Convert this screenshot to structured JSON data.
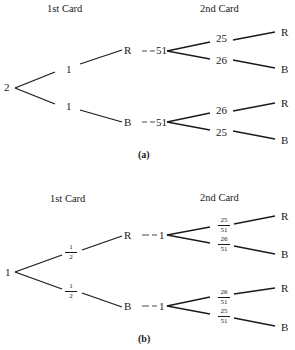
{
  "panel_a": {
    "header_first": "1st Card",
    "header_second": "2nd Card",
    "root": "2",
    "first_branches": [
      {
        "weight": "1",
        "node": "R",
        "link": "51",
        "second": [
          {
            "weight": "25",
            "leaf": "R"
          },
          {
            "weight": "26",
            "leaf": "B"
          }
        ]
      },
      {
        "weight": "1",
        "node": "B",
        "link": "51",
        "second": [
          {
            "weight": "26",
            "leaf": "R"
          },
          {
            "weight": "25",
            "leaf": "B"
          }
        ]
      }
    ],
    "caption": "(a)"
  },
  "panel_b": {
    "header_first": "1st Card",
    "header_second": "2nd Card",
    "root": "1",
    "first_branches": [
      {
        "weight": {
          "num": "1",
          "den": "2"
        },
        "node": "R",
        "link": "1",
        "second": [
          {
            "weight": {
              "num": "25",
              "den": "51"
            },
            "leaf": "R"
          },
          {
            "weight": {
              "num": "26",
              "den": "51"
            },
            "leaf": "B"
          }
        ]
      },
      {
        "weight": {
          "num": "1",
          "den": "2"
        },
        "node": "B",
        "link": "1",
        "second": [
          {
            "weight": {
              "num": "26",
              "den": "51"
            },
            "leaf": "R"
          },
          {
            "weight": {
              "num": "25",
              "den": "51"
            },
            "leaf": "B"
          }
        ]
      }
    ],
    "caption": "(b)"
  }
}
